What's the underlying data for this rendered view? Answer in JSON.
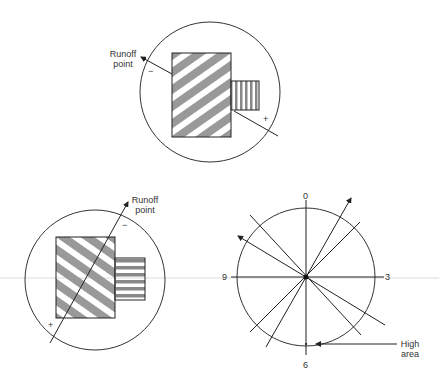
{
  "figure_top": {
    "runoff_label_1": "Runoff",
    "runoff_label_2": "point",
    "minus": "−",
    "plus": "+"
  },
  "figure_bottom_left": {
    "runoff_label_1": "Runoff",
    "runoff_label_2": "point",
    "minus": "−",
    "plus": "+"
  },
  "figure_clock": {
    "label_0": "0",
    "label_3": "3",
    "label_6": "6",
    "label_9": "9",
    "high_label_1": "High",
    "high_label_2": "area"
  }
}
